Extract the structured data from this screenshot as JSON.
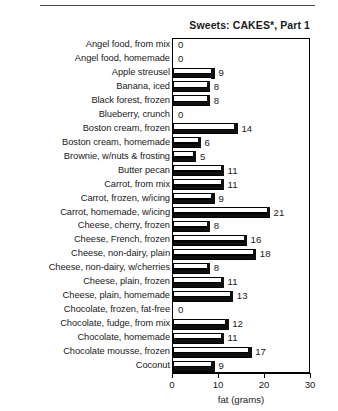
{
  "page": {
    "top_rule_present": true
  },
  "chart_data": {
    "type": "bar",
    "orientation": "horizontal",
    "title": "Sweets: CAKES*, Part 1",
    "xlabel": "fat (grams)",
    "ylabel": "",
    "xlim": [
      0,
      30
    ],
    "xticks": [
      0,
      10,
      20,
      30
    ],
    "xtick_labels": [
      "0",
      "10",
      "20",
      "30"
    ],
    "grid": false,
    "legend": false,
    "value_labels": true,
    "categories": [
      "Angel food, from mix",
      "Angel food, homemade",
      "Apple streusel",
      "Banana, iced",
      "Black forest, frozen",
      "Blueberry, crunch",
      "Boston cream, frozen",
      "Boston cream, homemade",
      "Brownie, w/nuts & frosting",
      "Butter pecan",
      "Carrot, from mix",
      "Carrot, frozen, w/icing",
      "Carrot, homemade, w/icing",
      "Cheese, cherry, frozen",
      "Cheese, French, frozen",
      "Cheese, non-dairy, plain",
      "Cheese, non-dairy, w/cherries",
      "Cheese, plain, frozen",
      "Cheese, plain, homemade",
      "Chocolate, frozen, fat-free",
      "Chocolate, fudge, from mix",
      "Chocolate, homemade",
      "Chocolate mousse, frozen",
      "Coconut"
    ],
    "values": [
      0,
      0,
      9,
      8,
      8,
      0,
      14,
      6,
      5,
      11,
      11,
      9,
      21,
      8,
      16,
      18,
      8,
      11,
      13,
      0,
      12,
      11,
      17,
      9
    ],
    "colors": {
      "bar_top_face": "#ffffff",
      "bar_front_face": "#101010",
      "bar_outline": "#000000",
      "axis": "#000000",
      "text": "#1a1a1a",
      "background": "#ffffff"
    }
  }
}
